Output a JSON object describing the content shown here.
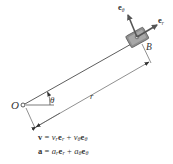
{
  "diagram": {
    "labels": {
      "origin": "O",
      "block": "B",
      "angle": "θ",
      "radius": "r",
      "unit_theta": "e",
      "unit_theta_sub": "θ",
      "unit_r": "e",
      "unit_r_sub": "r"
    },
    "equations": {
      "velocity": {
        "lhs": "v",
        "eq": " = ",
        "t1": "v",
        "t1_sub": "r",
        "t1_vec": "e",
        "t1_vec_sub": "r",
        "plus": " + ",
        "t2": "v",
        "t2_sub": "θ",
        "t2_vec": "e",
        "t2_vec_sub": "θ"
      },
      "acceleration": {
        "lhs": "a",
        "eq": " = ",
        "t1": "a",
        "t1_sub": "r",
        "t1_vec": "e",
        "t1_vec_sub": "r",
        "plus": " + ",
        "t2": "a",
        "t2_sub": "θ",
        "t2_vec": "e",
        "t2_vec_sub": "θ"
      }
    },
    "colors": {
      "line": "#333333",
      "block_fill": "#9a9a9a",
      "block_dark": "#6e6e6e",
      "arrow": "#555555"
    }
  }
}
